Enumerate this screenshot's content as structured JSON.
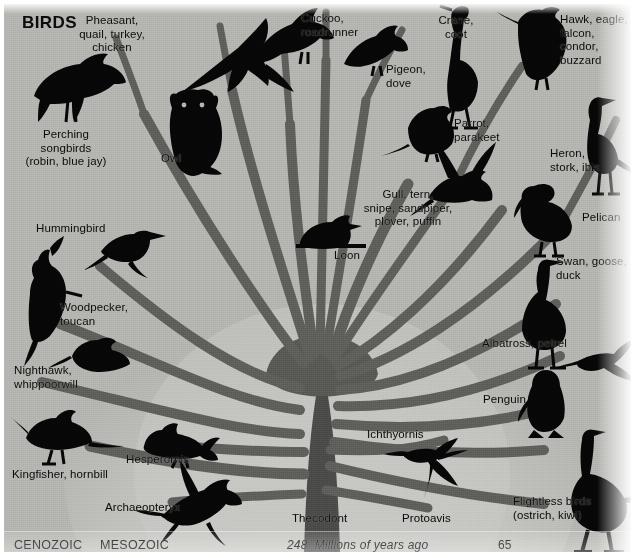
{
  "figure": {
    "title": "BIRDS",
    "domain": "phylogenetic-tree-diagram",
    "background_color": "#b4b4b0",
    "silhouette_color": "#060606",
    "branch_color": "#5f5f5c",
    "trunk_color": "#4a4a48",
    "highlight_wedge_color": "#c6c6c2"
  },
  "timeline": {
    "eras": [
      {
        "name": "CENOZOIC",
        "x": 10,
        "y": 535
      },
      {
        "name": "MESOZOIC",
        "x": 96,
        "y": 535
      }
    ],
    "scale_label": "248  Millions of years ago",
    "scale_start": "248",
    "scale_end": "65",
    "marks": [
      {
        "value": "248",
        "x": 283,
        "y": 535
      },
      {
        "value": "65",
        "x": 494,
        "y": 535
      }
    ]
  },
  "labels": [
    {
      "id": "birds-title",
      "text": "BIRDS",
      "x": 18,
      "y": 12,
      "align": "left",
      "kind": "title"
    },
    {
      "id": "pheasant",
      "text": "Pheasant,\nquail, turkey,\nchicken",
      "x": 108,
      "y": 10,
      "align": "center",
      "kind": "taxon"
    },
    {
      "id": "cuckoo",
      "text": "Cuckoo,\nroadrunner",
      "x": 297,
      "y": 8,
      "align": "left",
      "kind": "taxon"
    },
    {
      "id": "crane",
      "text": "Crane,\ncoot",
      "x": 452,
      "y": 10,
      "align": "center",
      "kind": "taxon"
    },
    {
      "id": "hawk",
      "text": "Hawk, eagle,\nfalcon,\ncondor,\nbuzzard",
      "x": 556,
      "y": 9,
      "align": "left",
      "kind": "taxon"
    },
    {
      "id": "pigeon",
      "text": "Pigeon,\ndove",
      "x": 382,
      "y": 59,
      "align": "left",
      "kind": "taxon"
    },
    {
      "id": "perching",
      "text": "Perching\nsongbirds\n(robin, blue jay)",
      "x": 62,
      "y": 124,
      "align": "center",
      "kind": "taxon"
    },
    {
      "id": "owl",
      "text": "Owl",
      "x": 157,
      "y": 148,
      "align": "left",
      "kind": "taxon"
    },
    {
      "id": "parrot",
      "text": "Parrot,\nparakeet",
      "x": 450,
      "y": 113,
      "align": "left",
      "kind": "taxon"
    },
    {
      "id": "heron",
      "text": "Heron,\nstork, ibis",
      "x": 546,
      "y": 143,
      "align": "left",
      "kind": "taxon"
    },
    {
      "id": "gull",
      "text": "Gull. tern,\nsnipe, sandpiper,\nplover, puffin",
      "x": 404,
      "y": 184,
      "align": "center",
      "kind": "taxon"
    },
    {
      "id": "hummingbird",
      "text": "Hummingbird",
      "x": 32,
      "y": 218,
      "align": "left",
      "kind": "taxon"
    },
    {
      "id": "pelican",
      "text": "Pelican",
      "x": 578,
      "y": 207,
      "align": "left",
      "kind": "taxon"
    },
    {
      "id": "loon",
      "text": "Loon",
      "x": 330,
      "y": 245,
      "align": "left",
      "kind": "taxon"
    },
    {
      "id": "swan",
      "text": "Swan, goose,\nduck",
      "x": 552,
      "y": 251,
      "align": "left",
      "kind": "taxon"
    },
    {
      "id": "woodpecker",
      "text": "Woodpecker,\ntoucan",
      "x": 56,
      "y": 297,
      "align": "left",
      "kind": "taxon"
    },
    {
      "id": "albatross",
      "text": "Albatross, petrel",
      "x": 478,
      "y": 333,
      "align": "left",
      "kind": "taxon"
    },
    {
      "id": "nighthawk",
      "text": "Nighthawk,\nwhippoorwill",
      "x": 10,
      "y": 360,
      "align": "left",
      "kind": "taxon"
    },
    {
      "id": "penguin",
      "text": "Penguin",
      "x": 479,
      "y": 389,
      "align": "left",
      "kind": "taxon"
    },
    {
      "id": "ichthyornis",
      "text": "Ichthyornis",
      "x": 363,
      "y": 424,
      "align": "left",
      "kind": "taxon"
    },
    {
      "id": "hesperornis",
      "text": "Hesperornis",
      "x": 122,
      "y": 449,
      "align": "left",
      "kind": "taxon"
    },
    {
      "id": "kingfisher",
      "text": "Kingfisher, hornbill",
      "x": 8,
      "y": 464,
      "align": "left",
      "kind": "taxon"
    },
    {
      "id": "archaeopteryx",
      "text": "Archaeopteryx",
      "x": 101,
      "y": 497,
      "align": "left",
      "kind": "taxon"
    },
    {
      "id": "thecodont",
      "text": "Thecodont",
      "x": 288,
      "y": 508,
      "align": "left",
      "kind": "taxon"
    },
    {
      "id": "protoavis",
      "text": "Protoavis",
      "x": 398,
      "y": 508,
      "align": "left",
      "kind": "taxon"
    },
    {
      "id": "flightless",
      "text": "Flightless birds\n(ostrich, kiwi)",
      "x": 509,
      "y": 491,
      "align": "left",
      "kind": "taxon"
    }
  ],
  "birds": [
    {
      "id": "perching-songbird",
      "name": "crow-silhouette",
      "x": 25,
      "y": 50,
      "w": 92,
      "h": 72,
      "rot": 0
    },
    {
      "id": "pheasant",
      "name": "pheasant-flying",
      "x": 168,
      "y": 8,
      "w": 120,
      "h": 80,
      "rot": 0
    },
    {
      "id": "cuckoo",
      "name": "cuckoo-perched",
      "x": 247,
      "y": 3,
      "w": 88,
      "h": 58,
      "rot": 0
    },
    {
      "id": "pigeon",
      "name": "pigeon-perched",
      "x": 338,
      "y": 22,
      "w": 62,
      "h": 50,
      "rot": 0
    },
    {
      "id": "crane",
      "name": "crane-standing",
      "x": 433,
      "y": 2,
      "w": 48,
      "h": 112,
      "rot": 0
    },
    {
      "id": "hawk",
      "name": "hawk-perched",
      "x": 508,
      "y": 4,
      "w": 62,
      "h": 80,
      "rot": 0
    },
    {
      "id": "owl",
      "name": "owl-perched",
      "x": 163,
      "y": 88,
      "w": 58,
      "h": 82,
      "rot": 0
    },
    {
      "id": "parrot",
      "name": "parrot-perched",
      "x": 400,
      "y": 104,
      "w": 56,
      "h": 48,
      "rot": 0
    },
    {
      "id": "heron",
      "name": "heron-standing",
      "x": 580,
      "y": 95,
      "w": 52,
      "h": 72,
      "rot": 0
    },
    {
      "id": "gull",
      "name": "gull-landing",
      "x": 418,
      "y": 152,
      "w": 78,
      "h": 62,
      "rot": 0
    },
    {
      "id": "pelican",
      "name": "pelican-standing",
      "x": 513,
      "y": 178,
      "w": 60,
      "h": 56,
      "rot": 0
    },
    {
      "id": "hummingbird",
      "name": "hummingbird-hovering",
      "x": 92,
      "y": 222,
      "w": 58,
      "h": 38,
      "rot": 0
    },
    {
      "id": "loon",
      "name": "loon-swimming",
      "x": 290,
      "y": 212,
      "w": 72,
      "h": 38,
      "rot": 0
    },
    {
      "id": "swan",
      "name": "goose-standing",
      "x": 525,
      "y": 255,
      "w": 60,
      "h": 70,
      "rot": 0
    },
    {
      "id": "woodpecker",
      "name": "woodpecker-perched",
      "x": 18,
      "y": 258,
      "w": 48,
      "h": 80,
      "rot": 0
    },
    {
      "id": "nighthawk",
      "name": "nighthawk-perched",
      "x": 62,
      "y": 335,
      "w": 60,
      "h": 34,
      "rot": 0
    },
    {
      "id": "albatross",
      "name": "albatross-gliding",
      "x": 570,
      "y": 330,
      "w": 74,
      "h": 56,
      "rot": 0
    },
    {
      "id": "penguin",
      "name": "penguin-standing",
      "x": 524,
      "y": 366,
      "w": 40,
      "h": 56,
      "rot": 0
    },
    {
      "id": "kingfisher",
      "name": "kingfisher-perched",
      "x": 15,
      "y": 412,
      "w": 80,
      "h": 48,
      "rot": 0
    },
    {
      "id": "hesperornis",
      "name": "hesperornis-swimming",
      "x": 135,
      "y": 420,
      "w": 70,
      "h": 40,
      "rot": 0
    },
    {
      "id": "ichthyornis",
      "name": "ichthyornis-flying",
      "x": 400,
      "y": 432,
      "w": 72,
      "h": 66,
      "rot": 0
    },
    {
      "id": "archaeopteryx",
      "name": "archaeopteryx-flying",
      "x": 152,
      "y": 474,
      "w": 92,
      "h": 68,
      "rot": 0
    },
    {
      "id": "flightless",
      "name": "ostrich-standing",
      "x": 560,
      "y": 428,
      "w": 74,
      "h": 110,
      "rot": 0
    }
  ],
  "chart_data": {
    "type": "diagram",
    "title": "BIRDS",
    "subtitle": "Evolutionary tree of modern bird orders",
    "xlabel": "248  Millions of years ago",
    "axis_ticks": [
      "248",
      "65"
    ],
    "eras": [
      "CENOZOIC",
      "MESOZOIC"
    ],
    "root": "Thecodont",
    "stem_taxa": [
      "Protoavis",
      "Archaeopteryx",
      "Hesperornis",
      "Ichthyornis"
    ],
    "crown_taxa": [
      "Perching songbirds (robin, blue jay)",
      "Pheasant, quail, turkey, chicken",
      "Cuckoo, roadrunner",
      "Pigeon, dove",
      "Crane, coot",
      "Hawk, eagle, falcon, condor, buzzard",
      "Owl",
      "Parrot, parakeet",
      "Heron, stork, ibis",
      "Gull. tern, snipe, sandpiper, plover, puffin",
      "Hummingbird",
      "Pelican",
      "Loon",
      "Swan, goose, duck",
      "Woodpecker, toucan",
      "Albatross, petrel",
      "Nighthawk, whippoorwill",
      "Penguin",
      "Kingfisher, hornbill",
      "Flightless birds (ostrich, kiwi)"
    ],
    "n_branches": 24,
    "legend": "none",
    "grid": false
  }
}
